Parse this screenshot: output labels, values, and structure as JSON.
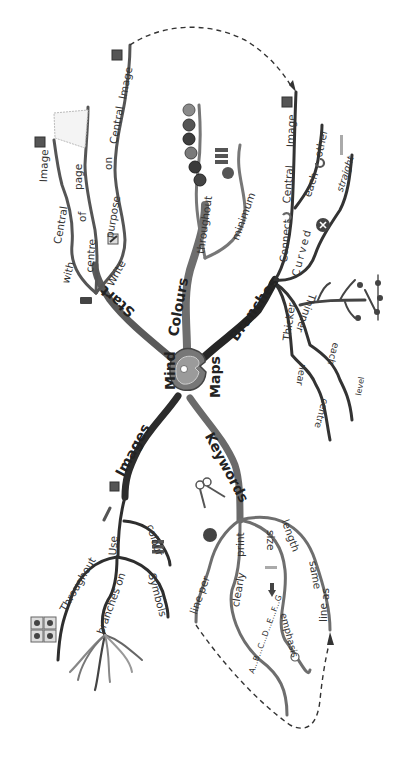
{
  "title": "Mind Maps",
  "central_image": {
    "label_left": "Mind",
    "label_right": "Maps"
  },
  "colors": {
    "branch_dark": "#2a2a2a",
    "branch_mid": "#6a6a6a",
    "branch_light": "#8a8a8a",
    "center_outer": "#7a7a7a",
    "center_inner": "#9a9a9a",
    "background": "#ffffff"
  },
  "branches": [
    {
      "name": "start",
      "label": "Start",
      "sub": [
        {
          "words": [
            "with",
            "Central",
            "Image"
          ]
        },
        {
          "words": [
            "centre",
            "of",
            "page"
          ]
        },
        {
          "words": [
            "Write",
            "purpose",
            "on",
            "Central",
            "Image"
          ]
        }
      ]
    },
    {
      "name": "colours",
      "label": "Colours",
      "sub": [
        {
          "words": [
            "throughout"
          ]
        },
        {
          "words": [
            "minimum",
            "3"
          ]
        }
      ]
    },
    {
      "name": "branches",
      "label": "Branches",
      "sub": [
        {
          "words": [
            "Connect",
            "Central",
            "Image"
          ]
        },
        {
          "words": [
            "each",
            "other"
          ]
        },
        {
          "words": [
            "Curved",
            "straight"
          ]
        },
        {
          "words": [
            "Thicker",
            "near",
            "centre"
          ]
        },
        {
          "words": [
            "Thinner",
            "each",
            "level"
          ]
        }
      ]
    },
    {
      "name": "images",
      "label": "Images",
      "sub": [
        {
          "words": [
            "Use",
            "colour"
          ]
        },
        {
          "words": [
            "Throughout"
          ]
        },
        {
          "words": [
            "branches",
            "on"
          ]
        },
        {
          "words": [
            "Symbols"
          ]
        }
      ]
    },
    {
      "name": "keywords",
      "label": "Keywords",
      "sub": [
        {
          "words": [
            "line",
            "per"
          ]
        },
        {
          "words": [
            "print",
            "clearly",
            "A...B...C...D...E...F...G"
          ]
        },
        {
          "words": [
            "size",
            "emphasis"
          ]
        },
        {
          "words": [
            "length",
            "same",
            "as",
            "line"
          ]
        }
      ]
    }
  ],
  "labels": {
    "mind": "Mind",
    "maps": "Maps",
    "start": "Start",
    "colours": "Colours",
    "branches": "Branches",
    "images": "Images",
    "keywords": "Keywords",
    "with": "with",
    "central1": "Central",
    "image1": "Image",
    "centre": "centre",
    "of": "of",
    "page": "page",
    "write": "Write",
    "purpose": "purpose",
    "on1": "on",
    "central2": "Central",
    "image2": "Image",
    "throughout1": "throughout",
    "minimum": "minimum",
    "three": "3",
    "connect": "Connect",
    "central3": "Central",
    "image3": "Image",
    "each1": "each",
    "other": "other",
    "curved": "Curved",
    "straight": "straight",
    "thicker": "Thicker",
    "near": "near",
    "centre2": "centre",
    "thinner": "Thinner",
    "each2": "each",
    "level": "level",
    "use": "Use",
    "colour": "colour",
    "throughout2": "Throughout",
    "branches_on": "branches on",
    "symbols": "Symbols",
    "line_per": "line per",
    "print": "print",
    "clearly": "clearly",
    "alphabet": "A...B...C...D...E...F...G",
    "size": "size",
    "emphasis": "emphasis",
    "length": "length",
    "same": "same",
    "as": "as",
    "line2": "line",
    "one": "1"
  },
  "icons": [
    "image-icon",
    "blank-page-icon",
    "pencil-icon",
    "battery-icon",
    "colour-balls-icon",
    "stack-icon",
    "number-three-icon",
    "arrows-connect-icon",
    "rotate-icon",
    "cross-circle-icon",
    "ruler-icon",
    "tree-icon",
    "roots-icon",
    "paintbrush-icon",
    "symbols-grid-icon",
    "keys-icon",
    "number-one-icon",
    "down-arrow-icon",
    "lightbulb-icon"
  ]
}
